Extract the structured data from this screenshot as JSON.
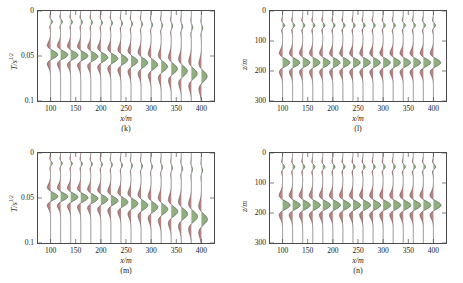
{
  "figure": {
    "background": "#ffffff",
    "axis_color": "#4a4a4a",
    "trace_line_color": "#3c3c3c",
    "peak_fill_color": "#6f9a5a",
    "trough_fill_color": "#9e5050"
  },
  "chart_data": [
    {
      "id": "k",
      "type": "line",
      "title": "",
      "caption": "(k)",
      "xlabel": "x/m",
      "ylabel": "T/s",
      "ylabel_sup": "1/2",
      "xlim": [
        75,
        425
      ],
      "ylim": [
        0,
        0.1
      ],
      "y_inverted": true,
      "xticks": [
        100,
        150,
        200,
        250,
        300,
        350,
        400
      ],
      "xticklabels": [
        "100",
        "150",
        "200",
        "250",
        "300",
        "350",
        "400"
      ],
      "yticks": [
        0,
        0.05,
        0.1
      ],
      "yticklabels": [
        "0",
        "0.05",
        "0.1"
      ],
      "grid": false,
      "trace_x": [
        100,
        120,
        140,
        160,
        180,
        200,
        220,
        240,
        260,
        280,
        300,
        320,
        340,
        360,
        380,
        400
      ],
      "event_center": [
        0.0485,
        0.0487,
        0.0492,
        0.0498,
        0.0506,
        0.0516,
        0.0528,
        0.0542,
        0.0558,
        0.0576,
        0.0596,
        0.0618,
        0.0642,
        0.0668,
        0.0696,
        0.0726
      ],
      "event_amplitude": [
        1.0,
        1.0,
        1.0,
        0.99,
        0.98,
        0.97,
        0.96,
        0.94,
        0.93,
        0.91,
        0.89,
        0.87,
        0.85,
        0.83,
        0.81,
        0.79
      ],
      "event_halfwidth": [
        0.0085,
        0.0085,
        0.0086,
        0.0087,
        0.0088,
        0.009,
        0.0092,
        0.0094,
        0.0096,
        0.0098,
        0.0101,
        0.0104,
        0.0107,
        0.011,
        0.0113,
        0.0117
      ],
      "direct_center": [
        0.012,
        0.012,
        0.0122,
        0.0124,
        0.0127,
        0.013,
        0.0134,
        0.0138,
        0.0143,
        0.0148,
        0.0154,
        0.016,
        0.0167,
        0.0174,
        0.0182,
        0.019
      ],
      "direct_amplitude": [
        0.26,
        0.25,
        0.25,
        0.24,
        0.24,
        0.23,
        0.23,
        0.22,
        0.22,
        0.21,
        0.21,
        0.2,
        0.2,
        0.19,
        0.19,
        0.18
      ]
    },
    {
      "id": "l",
      "type": "line",
      "title": "",
      "caption": "(l)",
      "xlabel": "x/m",
      "ylabel": "z/m",
      "ylabel_sup": "",
      "xlim": [
        75,
        425
      ],
      "ylim": [
        0,
        300
      ],
      "y_inverted": true,
      "xticks": [
        100,
        150,
        200,
        250,
        300,
        350,
        400
      ],
      "xticklabels": [
        "100",
        "150",
        "200",
        "250",
        "300",
        "350",
        "400"
      ],
      "yticks": [
        0,
        100,
        200,
        300
      ],
      "yticklabels": [
        "0",
        "100",
        "200",
        "300"
      ],
      "grid": false,
      "trace_x": [
        100,
        120,
        140,
        160,
        180,
        200,
        220,
        240,
        260,
        280,
        300,
        320,
        340,
        360,
        380,
        400
      ],
      "event_center": [
        172,
        172,
        172,
        172,
        172,
        172,
        172,
        172,
        172,
        172,
        172,
        172,
        172,
        172,
        172,
        172
      ],
      "event_amplitude": [
        1.0,
        1.0,
        1.0,
        1.0,
        1.0,
        1.0,
        1.0,
        1.0,
        1.0,
        1.0,
        1.0,
        1.0,
        1.0,
        1.0,
        1.0,
        1.0
      ],
      "event_halfwidth": [
        26,
        26,
        26,
        26,
        26,
        26,
        26,
        26,
        26,
        26,
        26,
        26,
        26,
        26,
        26,
        26
      ],
      "direct_center": [
        48,
        48,
        48,
        48,
        48,
        48,
        48,
        48,
        48,
        48,
        48,
        48,
        48,
        48,
        48,
        48
      ],
      "direct_amplitude": [
        0.3,
        0.3,
        0.3,
        0.3,
        0.3,
        0.3,
        0.3,
        0.3,
        0.3,
        0.3,
        0.3,
        0.3,
        0.3,
        0.3,
        0.3,
        0.3
      ]
    },
    {
      "id": "m",
      "type": "line",
      "title": "",
      "caption": "(m)",
      "xlabel": "x/m",
      "ylabel": "T/s",
      "ylabel_sup": "1/2",
      "xlim": [
        75,
        425
      ],
      "ylim": [
        0,
        0.1
      ],
      "y_inverted": true,
      "xticks": [
        100,
        150,
        200,
        250,
        300,
        350,
        400
      ],
      "xticklabels": [
        "100",
        "150",
        "200",
        "250",
        "300",
        "350",
        "400"
      ],
      "yticks": [
        0,
        0.05,
        0.1
      ],
      "yticklabels": [
        "0",
        "0.05",
        "0.1"
      ],
      "grid": false,
      "trace_x": [
        100,
        120,
        140,
        160,
        180,
        200,
        220,
        240,
        260,
        280,
        300,
        320,
        340,
        360,
        380,
        400
      ],
      "event_center": [
        0.0482,
        0.0485,
        0.049,
        0.0497,
        0.0506,
        0.0517,
        0.053,
        0.0545,
        0.0562,
        0.0581,
        0.0602,
        0.0625,
        0.065,
        0.0677,
        0.0706,
        0.0737
      ],
      "event_amplitude": [
        1.0,
        1.0,
        1.0,
        1.0,
        0.99,
        0.98,
        0.97,
        0.96,
        0.95,
        0.93,
        0.92,
        0.9,
        0.89,
        0.87,
        0.85,
        0.83
      ],
      "event_halfwidth": [
        0.0082,
        0.0083,
        0.0084,
        0.0085,
        0.0086,
        0.0088,
        0.009,
        0.0092,
        0.0095,
        0.0098,
        0.0101,
        0.0104,
        0.0108,
        0.0112,
        0.0116,
        0.012
      ],
      "direct_center": [
        0.0115,
        0.0116,
        0.0118,
        0.012,
        0.0123,
        0.0127,
        0.0131,
        0.0136,
        0.0141,
        0.0147,
        0.0153,
        0.016,
        0.0167,
        0.0175,
        0.0183,
        0.0192
      ],
      "direct_amplitude": [
        0.24,
        0.24,
        0.23,
        0.23,
        0.22,
        0.22,
        0.21,
        0.21,
        0.2,
        0.2,
        0.19,
        0.19,
        0.18,
        0.18,
        0.17,
        0.17
      ]
    },
    {
      "id": "n",
      "type": "line",
      "title": "",
      "caption": "(n)",
      "xlabel": "x/m",
      "ylabel": "z/m",
      "ylabel_sup": "",
      "xlim": [
        75,
        425
      ],
      "ylim": [
        0,
        300
      ],
      "y_inverted": true,
      "xticks": [
        100,
        150,
        200,
        250,
        300,
        350,
        400
      ],
      "xticklabels": [
        "100",
        "150",
        "200",
        "250",
        "300",
        "350",
        "400"
      ],
      "yticks": [
        0,
        100,
        200,
        300
      ],
      "yticklabels": [
        "0",
        "100",
        "200",
        "300"
      ],
      "grid": false,
      "trace_x": [
        100,
        120,
        140,
        160,
        180,
        200,
        220,
        240,
        260,
        280,
        300,
        320,
        340,
        360,
        380,
        400
      ],
      "event_center": [
        174,
        174,
        174,
        174,
        174,
        174,
        174,
        174,
        174,
        174,
        174,
        174,
        174,
        174,
        174,
        174
      ],
      "event_amplitude": [
        1.05,
        1.05,
        1.05,
        1.05,
        1.05,
        1.05,
        1.05,
        1.05,
        1.05,
        1.05,
        1.05,
        1.05,
        1.05,
        1.05,
        1.05,
        1.05
      ],
      "event_halfwidth": [
        27,
        27,
        27,
        27,
        27,
        27,
        27,
        27,
        27,
        27,
        27,
        27,
        27,
        27,
        27,
        27
      ],
      "direct_center": [
        46,
        46,
        46,
        46,
        46,
        46,
        46,
        46,
        46,
        46,
        46,
        46,
        46,
        46,
        46,
        46
      ],
      "direct_amplitude": [
        0.3,
        0.3,
        0.3,
        0.3,
        0.3,
        0.3,
        0.3,
        0.3,
        0.3,
        0.3,
        0.3,
        0.3,
        0.3,
        0.3,
        0.3,
        0.3
      ]
    }
  ]
}
